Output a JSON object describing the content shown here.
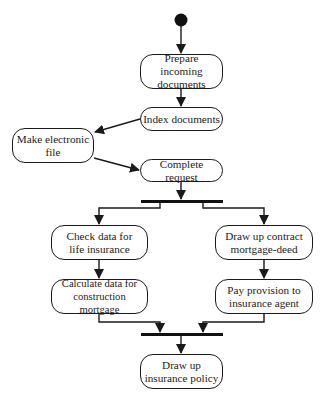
{
  "diagram": {
    "type": "uml-activity-diagram",
    "start_node": {
      "shape": "filled-circle"
    },
    "nodes": [
      {
        "id": "prepare",
        "label": "Prepare incoming\ndocuments"
      },
      {
        "id": "index",
        "label": "Index documents"
      },
      {
        "id": "electronic",
        "label": "Make electronic\nfile"
      },
      {
        "id": "complete",
        "label": "Complete request"
      },
      {
        "id": "check",
        "label": "Check data for\nlife insurance"
      },
      {
        "id": "contract",
        "label": "Draw up contract\nmortgage-deed"
      },
      {
        "id": "calculate",
        "label": "Calculate data for\nconstruction mortgage"
      },
      {
        "id": "provision",
        "label": "Pay provision to\ninsurance agent"
      },
      {
        "id": "policy",
        "label": "Draw up\ninsurance policy"
      }
    ],
    "bars": [
      {
        "id": "fork",
        "kind": "fork"
      },
      {
        "id": "join",
        "kind": "join"
      }
    ],
    "edges": [
      {
        "from": "start",
        "to": "prepare"
      },
      {
        "from": "prepare",
        "to": "index"
      },
      {
        "from": "index",
        "to": "electronic"
      },
      {
        "from": "electronic",
        "to": "complete"
      },
      {
        "from": "complete",
        "to": "fork"
      },
      {
        "from": "fork",
        "to": "check"
      },
      {
        "from": "fork",
        "to": "contract"
      },
      {
        "from": "check",
        "to": "calculate"
      },
      {
        "from": "contract",
        "to": "provision"
      },
      {
        "from": "calculate",
        "to": "join"
      },
      {
        "from": "provision",
        "to": "join"
      },
      {
        "from": "join",
        "to": "policy"
      }
    ],
    "colors": {
      "line": "#1a1a1a",
      "background": "#ffffff"
    }
  }
}
